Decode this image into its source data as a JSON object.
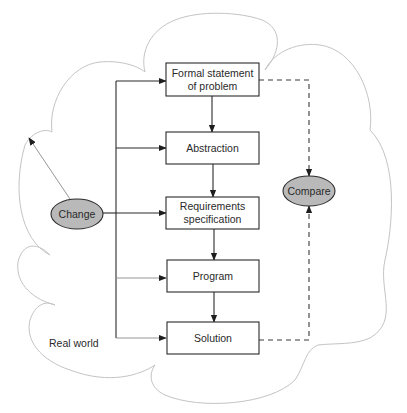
{
  "diagram": {
    "type": "flowchart",
    "region_label": "Real world",
    "boxes": [
      {
        "id": "formal",
        "lines": [
          "Formal statement",
          "of problem"
        ]
      },
      {
        "id": "abstraction",
        "lines": [
          "Abstraction"
        ]
      },
      {
        "id": "requirements",
        "lines": [
          "Requirements",
          "specification"
        ]
      },
      {
        "id": "program",
        "lines": [
          "Program"
        ]
      },
      {
        "id": "solution",
        "lines": [
          "Solution"
        ]
      }
    ],
    "ovals": [
      {
        "id": "change",
        "label": "Change"
      },
      {
        "id": "compare",
        "label": "Compare"
      }
    ],
    "edges": [
      {
        "from": "formal",
        "to": "abstraction",
        "style": "solid"
      },
      {
        "from": "abstraction",
        "to": "requirements",
        "style": "solid"
      },
      {
        "from": "requirements",
        "to": "program",
        "style": "solid"
      },
      {
        "from": "program",
        "to": "solution",
        "style": "solid"
      },
      {
        "from": "change",
        "to": "formal",
        "style": "solid"
      },
      {
        "from": "change",
        "to": "abstraction",
        "style": "solid"
      },
      {
        "from": "change",
        "to": "requirements",
        "style": "solid"
      },
      {
        "from": "change",
        "to": "program",
        "style": "solid"
      },
      {
        "from": "change",
        "to": "solution",
        "style": "solid"
      },
      {
        "from": "change",
        "to": "real-world",
        "style": "thin"
      },
      {
        "from": "formal",
        "to": "compare",
        "style": "dashed"
      },
      {
        "from": "solution",
        "to": "compare",
        "style": "dashed"
      }
    ],
    "colors": {
      "oval_fill": "#b9b9b9",
      "stroke": "#2b2b2b",
      "cloud_stroke": "#c4c4c4"
    }
  }
}
